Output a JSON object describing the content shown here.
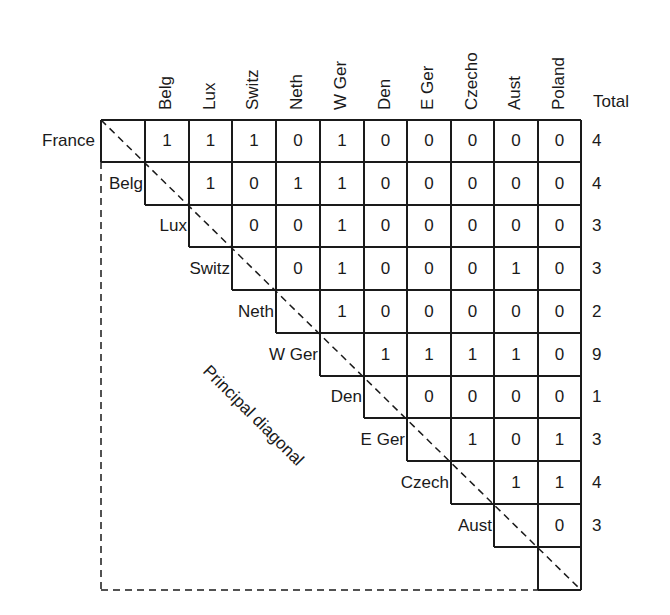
{
  "diagram": {
    "type": "connectivity_matrix",
    "columns": [
      "Belg",
      "Lux",
      "Switz",
      "Neth",
      "W Ger",
      "Den",
      "E Ger",
      "Czecho",
      "Aust",
      "Poland"
    ],
    "total_header": "Total",
    "rows": [
      {
        "label": "France",
        "values": [
          "1",
          "1",
          "1",
          "0",
          "1",
          "0",
          "0",
          "0",
          "0",
          "0"
        ],
        "total": "4"
      },
      {
        "label": "Belg",
        "values": [
          "1",
          "0",
          "1",
          "1",
          "0",
          "0",
          "0",
          "0",
          "0"
        ],
        "total": "4"
      },
      {
        "label": "Lux",
        "values": [
          "0",
          "0",
          "1",
          "0",
          "0",
          "0",
          "0",
          "0"
        ],
        "total": "3"
      },
      {
        "label": "Switz",
        "values": [
          "0",
          "1",
          "0",
          "0",
          "0",
          "1",
          "0"
        ],
        "total": "3"
      },
      {
        "label": "Neth",
        "values": [
          "1",
          "0",
          "0",
          "0",
          "0",
          "0"
        ],
        "total": "2"
      },
      {
        "label": "W Ger",
        "values": [
          "1",
          "1",
          "1",
          "1",
          "0"
        ],
        "total": "9"
      },
      {
        "label": "Den",
        "values": [
          "0",
          "0",
          "0",
          "0"
        ],
        "total": "1"
      },
      {
        "label": "E Ger",
        "values": [
          "1",
          "0",
          "1"
        ],
        "total": "3"
      },
      {
        "label": "Czech",
        "values": [
          "1",
          "1"
        ],
        "total": "4"
      },
      {
        "label": "Aust",
        "values": [
          "0"
        ],
        "total": "3"
      },
      {
        "label": "",
        "values": [],
        "total": ""
      }
    ],
    "diagonal_label": "Principal diagonal",
    "colors": {
      "ink": "#1a1a1a",
      "background": "#ffffff"
    }
  }
}
